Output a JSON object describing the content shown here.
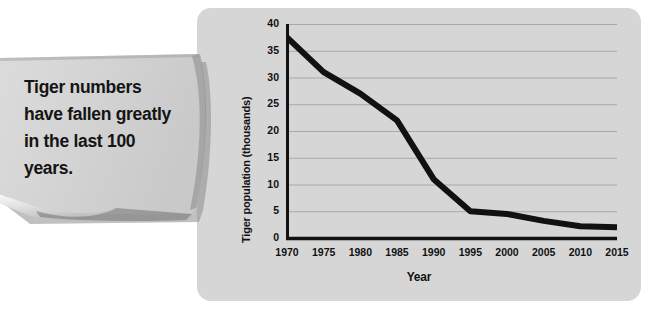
{
  "callout": {
    "text": "Tiger numbers have fallen greatly in the last 100 years."
  },
  "colors": {
    "panel_background": "#d6d6d6",
    "note_background": "#d3d3d3",
    "line_color": "#111111",
    "grid_color": "#a8a8a8",
    "axis_color": "#111111",
    "text_color": "#141414"
  },
  "chart_data": {
    "type": "line",
    "title": "",
    "xlabel": "Year",
    "ylabel": "Tiger population (thousands)",
    "x": [
      1970,
      1975,
      1980,
      1985,
      1990,
      1995,
      2000,
      2005,
      2010,
      2015
    ],
    "values": [
      37.5,
      31,
      27,
      22,
      11,
      5,
      4.5,
      3.2,
      2.2,
      2
    ],
    "categories": [
      "1970",
      "1975",
      "1980",
      "1985",
      "1990",
      "1995",
      "2000",
      "2005",
      "2010",
      "2015"
    ],
    "xlim": [
      1970,
      2015
    ],
    "ylim": [
      0,
      40
    ],
    "yticks": [
      0,
      5,
      10,
      15,
      20,
      25,
      30,
      35,
      40
    ],
    "ytick_labels": [
      "0",
      "5",
      "10",
      "15",
      "20",
      "25",
      "30",
      "35",
      "40"
    ],
    "xticks": [
      1970,
      1975,
      1980,
      1985,
      1990,
      1995,
      2000,
      2005,
      2010,
      2015
    ],
    "xtick_labels": [
      "1970",
      "1975",
      "1980",
      "1985",
      "1990",
      "1995",
      "2000",
      "2005",
      "2010",
      "2015"
    ],
    "grid": true,
    "grid_axis": "y",
    "legend": false,
    "series": [
      {
        "name": "Tiger population (thousands)",
        "values": [
          37.5,
          31,
          27,
          22,
          11,
          5,
          4.5,
          3.2,
          2.2,
          2
        ]
      }
    ]
  }
}
